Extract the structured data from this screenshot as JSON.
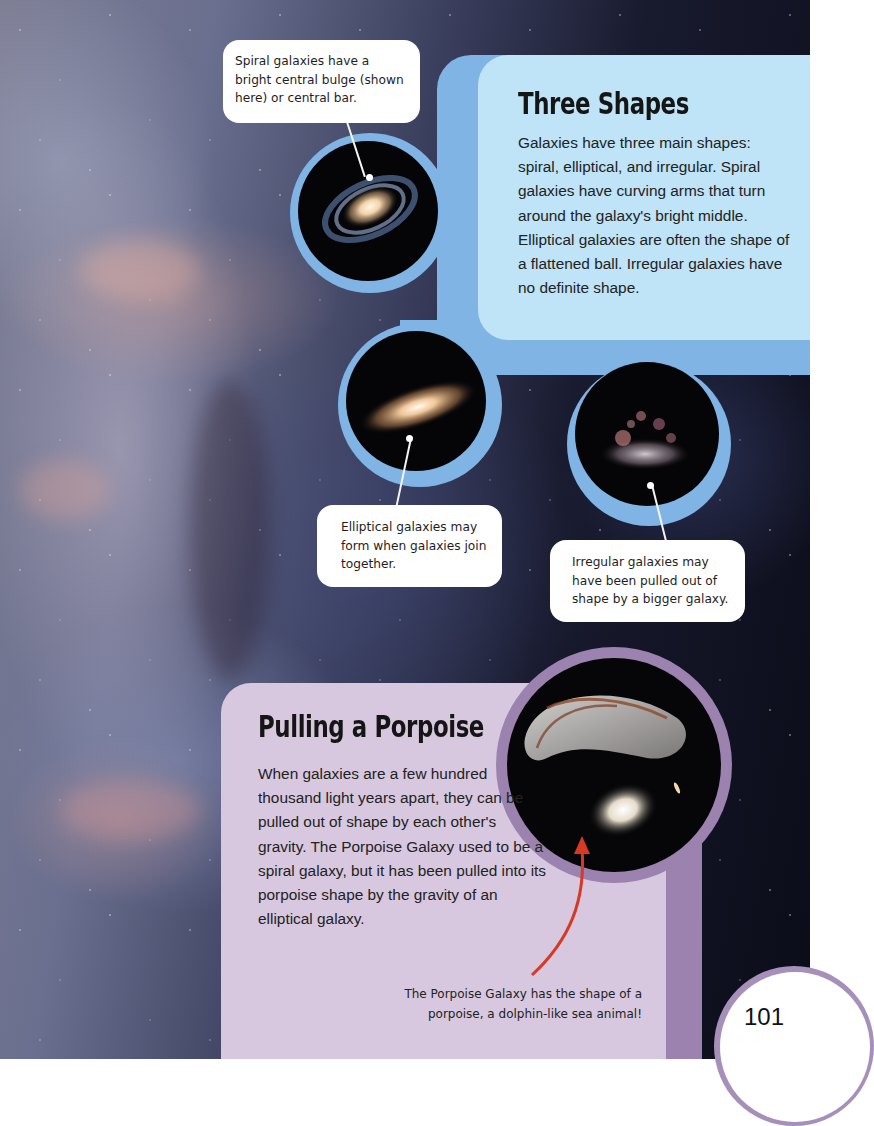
{
  "page": {
    "number": "101",
    "background": "galaxy star field photograph"
  },
  "three_shapes": {
    "title": "Three Shapes",
    "body": "Galaxies have three main shapes: spiral, elliptical, and irregular. Spiral galaxies have curving arms that turn around the galaxy's bright middle. Elliptical galaxies are often the shape of a flattened ball. Irregular galaxies have no definite shape.",
    "panel_color": "#bfe3f7",
    "frame_color": "#7fb4e4"
  },
  "galaxies": [
    {
      "type": "spiral",
      "image": "spiral-galaxy-image",
      "caption": "Spiral galaxies have a bright central bulge (shown here) or central bar."
    },
    {
      "type": "elliptical",
      "image": "elliptical-galaxy-image",
      "caption": "Elliptical galaxies may form when galaxies join together."
    },
    {
      "type": "irregular",
      "image": "irregular-galaxy-image",
      "caption": "Irregular galaxies may have been pulled out of shape by a bigger galaxy."
    }
  ],
  "porpoise": {
    "title": "Pulling a Porpoise",
    "body": "When galaxies are a few hundred thousand light years apart, they can be pulled out of shape by each other's gravity. The Porpoise Galaxy used to be a spiral galaxy, but it has been pulled into its porpoise shape by the gravity of an elliptical galaxy.",
    "image": "porpoise-galaxy-image",
    "caption": "The Porpoise Galaxy has the shape of a porpoise, a dolphin-like sea animal!",
    "panel_color": "#d8c8df",
    "frame_color": "#9b82af",
    "arrow_color": "#d63a25"
  }
}
